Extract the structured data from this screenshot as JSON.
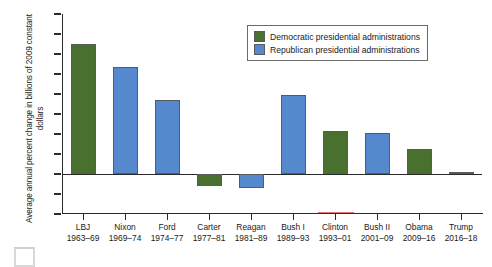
{
  "chart_data": {
    "type": "bar",
    "title": "",
    "xlabel": "",
    "ylabel": "Average annual percent change in billions of 2009 constant dollars",
    "ylim": [
      -0.04,
      0.16
    ],
    "ytick_values": [
      0.16,
      0.14,
      0.12,
      0.1,
      0.08,
      0.06,
      0.04,
      0.02,
      0.0,
      -0.02,
      -0.04
    ],
    "ytick_labels": [
      "0.16",
      "0.14",
      "0.12",
      "0.1",
      "0.08",
      "0.06",
      "0.04",
      "0.02",
      "0.0",
      "−0.02",
      "−0.04"
    ],
    "grid": false,
    "legend_position": "top-right",
    "categories": [
      "LBJ",
      "Nixon",
      "Ford",
      "Carter",
      "Reagan",
      "Bush I",
      "Clinton",
      "Bush II",
      "Obama",
      "Trump"
    ],
    "category_terms": [
      "1963–69",
      "1969–74",
      "1974–77",
      "1977–81",
      "1981–89",
      "1989–93",
      "1993–01",
      "2001–09",
      "2009–16",
      "2016–18"
    ],
    "values": [
      0.13,
      0.107,
      0.074,
      -0.012,
      -0.014,
      0.079,
      0.043,
      0.041,
      0.025,
      0.002
    ],
    "party": [
      "Democratic",
      "Republican",
      "Republican",
      "Democratic",
      "Republican",
      "Republican",
      "Democratic",
      "Republican",
      "Democratic",
      "Republican"
    ],
    "series": [
      {
        "name": "Democratic presidential administrations",
        "color": "#4a7030",
        "points": [
          {
            "category": "LBJ",
            "term": "1963–69",
            "value": 0.13
          },
          {
            "category": "Carter",
            "term": "1977–81",
            "value": -0.012
          },
          {
            "category": "Clinton",
            "term": "1993–01",
            "value": 0.043
          },
          {
            "category": "Obama",
            "term": "2009–16",
            "value": 0.025
          }
        ]
      },
      {
        "name": "Republican presidential administrations",
        "color": "#5588cc",
        "points": [
          {
            "category": "Nixon",
            "term": "1969–74",
            "value": 0.107
          },
          {
            "category": "Ford",
            "term": "1974–77",
            "value": 0.074
          },
          {
            "category": "Reagan",
            "term": "1981–89",
            "value": -0.014
          },
          {
            "category": "Bush I",
            "term": "1989–93",
            "value": 0.079
          },
          {
            "category": "Bush II",
            "term": "2001–09",
            "value": 0.041
          },
          {
            "category": "Trump",
            "term": "2016–18",
            "value": 0.002
          }
        ]
      }
    ]
  },
  "legend": {
    "items": [
      {
        "label": "Democratic presidential administrations",
        "color": "#4a7030"
      },
      {
        "label": "Republican presidential administrations",
        "color": "#5588cc"
      }
    ]
  },
  "colors": {
    "democratic": "#4a7030",
    "republican": "#5588cc",
    "axis": "#2b2b2b",
    "bar_outline": "#5a5a5a"
  }
}
